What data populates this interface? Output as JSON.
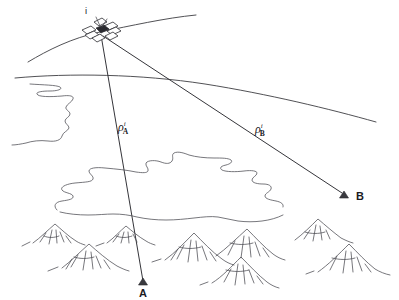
{
  "figure": {
    "background_color": "#ffffff",
    "line_color": "#3d3d42",
    "width": 399,
    "height": 300
  },
  "satellite": {
    "label": "i",
    "label_x": 88,
    "label_y": 16,
    "x": 100,
    "y": 32,
    "icon": "satellite-icon"
  },
  "orbit": {
    "name": "orbit-arc",
    "start": [
      28,
      62
    ],
    "end": [
      196,
      15
    ],
    "through_satellite": true
  },
  "ionosphere": {
    "name": "ionosphere-curve",
    "start": [
      15,
      78
    ],
    "end": [
      376,
      122
    ]
  },
  "rays": [
    {
      "name": "ray-to-a",
      "label": "ρ",
      "superscript": "i",
      "subscript": "A",
      "from": [
        101,
        35
      ],
      "to": [
        143,
        282
      ],
      "label_x": 118,
      "label_y": 121
    },
    {
      "name": "ray-to-b",
      "label": "ρ",
      "superscript": "i",
      "subscript": "B",
      "from": [
        103,
        36
      ],
      "to": [
        343,
        194
      ],
      "label_x": 255,
      "label_y": 123
    }
  ],
  "stations": [
    {
      "id": "station-a",
      "label": "A",
      "marker_x": 143,
      "marker_y": 283,
      "label_x": 137,
      "label_y": 297
    },
    {
      "id": "station-b",
      "label": "B",
      "marker_x": 345,
      "marker_y": 196,
      "label_x": 353,
      "label_y": 201
    }
  ],
  "terrain": {
    "coastline_name": "coastline-outline",
    "contour_name": "terrain-contour",
    "mountains_name": "mountain-range",
    "mountain_count": 8
  }
}
